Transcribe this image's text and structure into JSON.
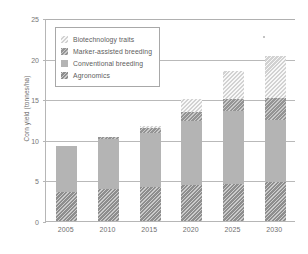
{
  "chart_data": {
    "type": "bar",
    "subtype": "stacked-bar",
    "title": "",
    "xlabel": "",
    "ylabel": "Corn yield (tonnes/ha)",
    "categories": [
      "2005",
      "2010",
      "2015",
      "2020",
      "2025",
      "2030"
    ],
    "ylim": [
      0,
      25
    ],
    "yticks": [
      0,
      5,
      10,
      15,
      20,
      25
    ],
    "grid": true,
    "legend_position": "upper-left-inside",
    "series": [
      {
        "name": "Agronomics",
        "color": "#8e8e8e",
        "pattern": "diagonal-hatch",
        "values": [
          3.6,
          3.9,
          4.2,
          4.4,
          4.6,
          4.8
        ]
      },
      {
        "name": "Conventional breeding",
        "color": "#b4b4b4",
        "pattern": "solid",
        "values": [
          5.6,
          6.2,
          6.7,
          7.9,
          8.9,
          7.6
        ]
      },
      {
        "name": "Marker-assisted breeding",
        "color": "#949494",
        "pattern": "diagonal-hatch",
        "values": [
          0.0,
          0.2,
          0.5,
          1.1,
          1.5,
          2.7
        ]
      },
      {
        "name": "Biotechnology traits",
        "color": "#d2d2d2",
        "pattern": "light-diagonal-hatch",
        "values": [
          0.0,
          0.0,
          0.3,
          1.6,
          3.5,
          5.2
        ]
      }
    ],
    "totals": [
      9.2,
      10.3,
      11.7,
      15.0,
      18.5,
      20.3
    ]
  },
  "legend": {
    "items": [
      {
        "label": "Biotechnology traits"
      },
      {
        "label": "Marker-assisted breeding"
      },
      {
        "label": "Conventional breeding"
      },
      {
        "label": "Agronomics"
      }
    ]
  }
}
